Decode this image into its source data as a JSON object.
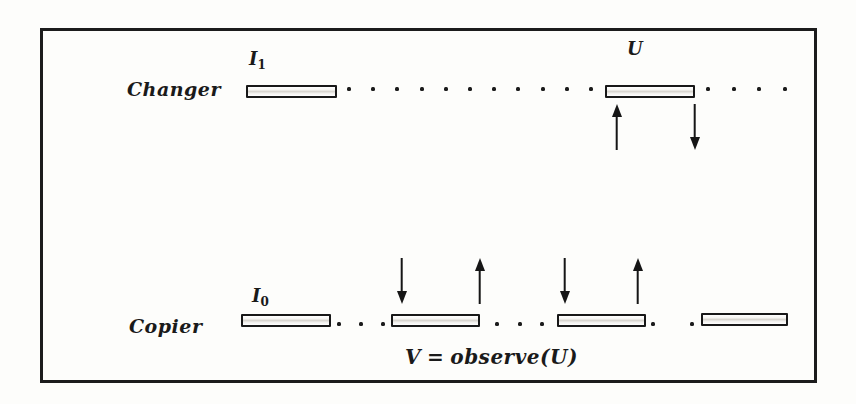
{
  "figure": {
    "type": "diagram",
    "ink_color": "#1a1a1a",
    "paper_color": "#fdfdfb"
  },
  "changer": {
    "label": "Changer",
    "head_cell_label": {
      "base": "I",
      "sub": "1"
    },
    "current_cell_label": "U",
    "gap1_dots": 11,
    "gap2_dots": 4,
    "arrows": [
      {
        "dir": "up",
        "position": "below-left-of-U-cell"
      },
      {
        "dir": "down",
        "position": "below-right-of-U-cell"
      }
    ]
  },
  "copier": {
    "label": "Copier",
    "head_cell_label": {
      "base": "I",
      "sub": "0"
    },
    "gap1_dots": 3,
    "gap2_dots": 3,
    "gap3_dots": 2,
    "arrows": [
      {
        "dir": "down",
        "position": "above-left-of-cell-2"
      },
      {
        "dir": "up",
        "position": "above-right-of-cell-2"
      },
      {
        "dir": "down",
        "position": "above-left-of-cell-3"
      },
      {
        "dir": "up",
        "position": "above-right-of-cell-3"
      }
    ]
  },
  "formula": {
    "lhs": "V",
    "relation": "=",
    "rhs": "observe(U)"
  }
}
